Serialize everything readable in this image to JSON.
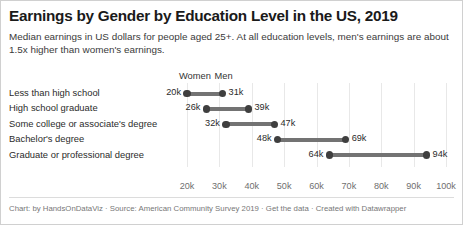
{
  "header": {
    "title": "Earnings by Gender by Education Level in the US, 2019",
    "subtitle": "Median earnings in US dollars for people aged 25+. At all education levels, men's earnings are about 1.5x higher than women's earnings."
  },
  "footer": {
    "credits": "Chart: by HandsOnDataViz · Source: American Community Survey 2019 · Get the data · Created with Datawrapper"
  },
  "colors": {
    "dot": "#3f3f3f",
    "connector": "#737373",
    "gridline": "#e8e8e8",
    "text": "#2b2b2b",
    "tick_text": "#6f6f6f",
    "background": "#ffffff",
    "border": "#d0d0d0"
  },
  "chart_data": {
    "type": "bar",
    "subtype": "dumbbell",
    "title": "Earnings by Gender by Education Level in the US, 2019",
    "subtitle": "Median earnings in US dollars for people aged 25+. At all education levels, men's earnings are about 1.5x higher than women's earnings.",
    "xlabel": "",
    "ylabel": "",
    "xlim": [
      17000,
      103000
    ],
    "grid": true,
    "legend_position": "above-first-row",
    "ticks": [
      "20k",
      "30k",
      "40k",
      "50k",
      "60k",
      "70k",
      "80k",
      "90k",
      "100k"
    ],
    "tick_values": [
      20000,
      30000,
      40000,
      50000,
      60000,
      70000,
      80000,
      90000,
      100000
    ],
    "categories": [
      "Less than high school",
      "High school graduate",
      "Some college or associate's degree",
      "Bachelor's degree",
      "Graduate or professional degree"
    ],
    "series": [
      {
        "name": "Women",
        "values": [
          20000,
          26000,
          32000,
          48000,
          64000
        ],
        "labels": [
          "20k",
          "26k",
          "32k",
          "48k",
          "64k"
        ]
      },
      {
        "name": "Men",
        "values": [
          31000,
          39000,
          47000,
          69000,
          94000
        ],
        "labels": [
          "31k",
          "39k",
          "47k",
          "69k",
          "94k"
        ]
      }
    ]
  }
}
